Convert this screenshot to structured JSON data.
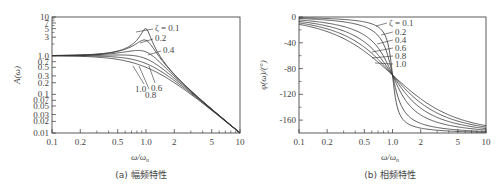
{
  "chart_data": [
    {
      "type": "line",
      "title": "(a) 幅频特性",
      "xlabel": "ω/ω_n",
      "ylabel": "A(ω)",
      "xscale": "log",
      "yscale": "log",
      "xlim": [
        0.1,
        10
      ],
      "ylim": [
        0.01,
        10
      ],
      "x_ticks": [
        "0.1",
        "0.2",
        "0.5",
        "1.0",
        "2",
        "5",
        "10"
      ],
      "y_ticks": [
        "0.01",
        "0.02",
        "0.03",
        "0.05",
        "0.07",
        "0.1",
        "0.2",
        "0.3",
        "0.5",
        "0.7",
        "1.0",
        "3",
        "5",
        "7",
        "10"
      ],
      "grid": false,
      "series": [
        {
          "name": "ζ = 0.1",
          "zeta": 0.1,
          "peak": 5.0
        },
        {
          "name": "0.2",
          "zeta": 0.2,
          "peak": 2.5
        },
        {
          "name": "0.4",
          "zeta": 0.4,
          "peak": 1.36
        },
        {
          "name": "0.6",
          "zeta": 0.6
        },
        {
          "name": "0.8",
          "zeta": 0.8
        },
        {
          "name": "1.0",
          "zeta": 1.0
        }
      ],
      "annotations": [
        "ζ = 0.1",
        "0.2",
        "0.4",
        "0.6",
        "0.8",
        "1.0"
      ]
    },
    {
      "type": "line",
      "title": "(b) 相频特性",
      "xlabel": "ω/ω_n",
      "ylabel": "φ(ω)/(°)",
      "xscale": "log",
      "yscale": "linear",
      "xlim": [
        0.1,
        10
      ],
      "ylim": [
        -180,
        0
      ],
      "x_ticks": [
        "0.1",
        "0.2",
        "0.5",
        "1.0",
        "2",
        "5",
        "10"
      ],
      "y_ticks": [
        "0",
        "-40",
        "-80",
        "-120",
        "-160"
      ],
      "grid": false,
      "series": [
        {
          "name": "ζ = 0.1",
          "zeta": 0.1
        },
        {
          "name": "0.2",
          "zeta": 0.2
        },
        {
          "name": "0.4",
          "zeta": 0.4
        },
        {
          "name": "0.6",
          "zeta": 0.6
        },
        {
          "name": "0.8",
          "zeta": 0.8
        },
        {
          "name": "1.0",
          "zeta": 1.0
        }
      ],
      "annotations": [
        "ζ = 0.1",
        "0.2",
        "0.4",
        "0.6",
        "0.8",
        "1.0"
      ]
    }
  ],
  "left": {
    "ylabel": "A(ω)",
    "xlabel": "ω/ω",
    "xlabel_sub": "n",
    "caption": "(a) 幅频特性",
    "xticks": [
      {
        "v": 0.1,
        "t": "0.1"
      },
      {
        "v": 0.2,
        "t": "0.2"
      },
      {
        "v": 0.5,
        "t": "0.5"
      },
      {
        "v": 1,
        "t": "1.0"
      },
      {
        "v": 2,
        "t": "2"
      },
      {
        "v": 5,
        "t": "5"
      },
      {
        "v": 10,
        "t": "10"
      }
    ],
    "yticks": [
      {
        "v": 0.01,
        "t": "0.01"
      },
      {
        "v": 0.02,
        "t": "0.02"
      },
      {
        "v": 0.03,
        "t": "0.03"
      },
      {
        "v": 0.05,
        "t": "0.05"
      },
      {
        "v": 0.07,
        "t": "0.07"
      },
      {
        "v": 0.1,
        "t": "0.1"
      },
      {
        "v": 0.2,
        "t": "0.2"
      },
      {
        "v": 0.3,
        "t": "0.3"
      },
      {
        "v": 0.5,
        "t": "0.5"
      },
      {
        "v": 0.7,
        "t": "0.7"
      },
      {
        "v": 1,
        "t": "1.0"
      },
      {
        "v": 3,
        "t": "3"
      },
      {
        "v": 5,
        "t": "5"
      },
      {
        "v": 7,
        "t": "7"
      },
      {
        "v": 10,
        "t": "10"
      }
    ],
    "labels": [
      {
        "t": "ζ = 0.1",
        "x": 155,
        "y": 31,
        "lx1": 136,
        "ly1": 32,
        "lx2": 153,
        "ly2": 29
      },
      {
        "t": "0.2",
        "x": 155,
        "y": 41,
        "lx1": 140,
        "ly1": 43,
        "lx2": 153,
        "ly2": 39
      },
      {
        "t": "0.4",
        "x": 163,
        "y": 53,
        "lx1": 148,
        "ly1": 55,
        "lx2": 161,
        "ly2": 51
      },
      {
        "t": "1.0",
        "x": 135,
        "y": 92,
        "lx1": 133,
        "ly1": 66,
        "lx2": 144,
        "ly2": 84
      },
      {
        "t": "0.8",
        "x": 145,
        "y": 98,
        "lx1": 139,
        "ly1": 66,
        "lx2": 149,
        "ly2": 89
      },
      {
        "t": "0.6",
        "x": 151,
        "y": 91,
        "lx1": 149,
        "ly1": 66,
        "lx2": 155,
        "ly2": 83
      }
    ]
  },
  "right": {
    "ylabel": "φ(ω)/(°)",
    "xlabel": "ω/ω",
    "xlabel_sub": "n",
    "caption": "(b) 相频特性",
    "xticks": [
      {
        "v": 0.1,
        "t": "0.1"
      },
      {
        "v": 0.2,
        "t": "0.2"
      },
      {
        "v": 0.5,
        "t": "0.5"
      },
      {
        "v": 1,
        "t": "1.0"
      },
      {
        "v": 2,
        "t": "2"
      },
      {
        "v": 5,
        "t": "5"
      },
      {
        "v": 10,
        "t": "10"
      }
    ],
    "yticks": [
      {
        "v": 0,
        "t": "0"
      },
      {
        "v": -40,
        "t": "-40"
      },
      {
        "v": -80,
        "t": "-80"
      },
      {
        "v": -120,
        "t": "-120"
      },
      {
        "v": -160,
        "t": "-160"
      }
    ],
    "labels": [
      {
        "t": "ζ = 0.1",
        "x": 389,
        "y": 26,
        "lx1": 376,
        "ly1": 26,
        "lx2": 387,
        "ly2": 23
      },
      {
        "t": "0.2",
        "x": 395,
        "y": 35,
        "lx1": 381,
        "ly1": 35,
        "lx2": 393,
        "ly2": 32
      },
      {
        "t": "0.4",
        "x": 395,
        "y": 43,
        "lx1": 377,
        "ly1": 44,
        "lx2": 393,
        "ly2": 40
      },
      {
        "t": "0.6",
        "x": 395,
        "y": 51,
        "lx1": 372,
        "ly1": 52,
        "lx2": 393,
        "ly2": 48
      },
      {
        "t": "0.8",
        "x": 395,
        "y": 59,
        "lx1": 372,
        "ly1": 58,
        "lx2": 393,
        "ly2": 56
      },
      {
        "t": "1.0",
        "x": 395,
        "y": 67,
        "lx1": 375,
        "ly1": 63,
        "lx2": 393,
        "ly2": 64
      }
    ]
  }
}
